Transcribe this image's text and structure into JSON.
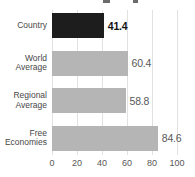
{
  "chart_data": {
    "type": "bar",
    "orientation": "horizontal",
    "categories": [
      "Country",
      "World\nAverage",
      "Regional\nAverage",
      "Free\nEconomies"
    ],
    "values": [
      41.4,
      60.4,
      58.8,
      84.6
    ],
    "value_labels": [
      "41.4",
      "60.4",
      "58.8",
      "84.6"
    ],
    "highlight_index": 0,
    "title": "",
    "xlabel": "",
    "ylabel": "",
    "xlim": [
      0,
      100
    ],
    "x_ticks": [
      0,
      20,
      40,
      60,
      80,
      100
    ],
    "x_tick_labels": [
      "0",
      "20",
      "40",
      "60",
      "80",
      "100"
    ],
    "grid": "vertical",
    "legend": "none",
    "colors": {
      "bar_default": "#b5b5b5",
      "bar_highlight": "#1d1d1d",
      "gridline": "#e1e1e1",
      "category_label": "#474747",
      "value_label": "#585858",
      "value_label_highlight": "#111111",
      "axis_label": "#585858",
      "background": "#ffffff"
    }
  }
}
